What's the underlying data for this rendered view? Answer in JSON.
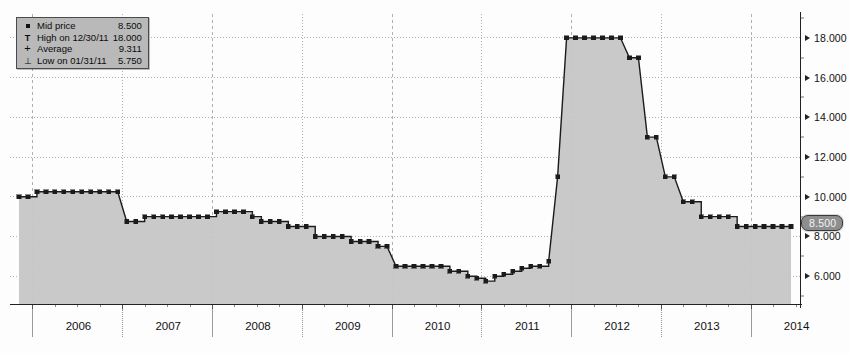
{
  "legend": {
    "rows": [
      {
        "glyph": "square-marker",
        "label": "Mid price",
        "value": "8.500"
      },
      {
        "glyph": "high-marker",
        "label": "High on 12/30/11",
        "value": "18.000"
      },
      {
        "glyph": "average-marker",
        "label": "Average",
        "value": "9.311"
      },
      {
        "glyph": "low-marker",
        "label": "Low on 01/31/11",
        "value": "5.750"
      }
    ]
  },
  "price_badge": {
    "value": "8.500"
  },
  "colors": {
    "line": "#1b1b1b",
    "fill": "#c6c6c6",
    "grid": "#b0b0b0",
    "axis": "#222222",
    "badge_bg": "#8e8e8e",
    "legend_bg": "#b9b9b9"
  },
  "chart_data": {
    "type": "area",
    "title": "",
    "xlabel": "",
    "ylabel": "",
    "grid": true,
    "legend_position": "top-left",
    "xlim": [
      2005.75,
      2014.55
    ],
    "ylim": [
      4.6,
      19.2
    ],
    "yticks": [
      6.0,
      8.0,
      10.0,
      12.0,
      14.0,
      16.0,
      18.0
    ],
    "ytick_labels": [
      "6.000",
      "8.000",
      "10.000",
      "12.000",
      "14.000",
      "16.000",
      "18.000"
    ],
    "xticks": [
      2006,
      2007,
      2008,
      2009,
      2010,
      2011,
      2012,
      2013,
      2014
    ],
    "xtick_labels": [
      "2006",
      "2007",
      "2008",
      "2009",
      "2010",
      "2011",
      "2012",
      "2013",
      "2014"
    ],
    "annotations": {
      "high": {
        "label": "High on 12/30/11",
        "value": 18.0
      },
      "low": {
        "label": "Low on 01/31/11",
        "value": 5.75
      },
      "average": {
        "label": "Average",
        "value": 9.311
      },
      "last": {
        "label": "Mid price",
        "value": 8.5
      }
    },
    "series": [
      {
        "name": "Mid price",
        "marker": "square",
        "x": [
          2005.85,
          2005.95,
          2006.05,
          2006.15,
          2006.25,
          2006.35,
          2006.45,
          2006.55,
          2006.65,
          2006.75,
          2006.85,
          2006.95,
          2007.05,
          2007.15,
          2007.25,
          2007.35,
          2007.45,
          2007.55,
          2007.65,
          2007.75,
          2007.85,
          2007.95,
          2008.05,
          2008.15,
          2008.25,
          2008.35,
          2008.45,
          2008.55,
          2008.65,
          2008.75,
          2008.85,
          2008.95,
          2009.05,
          2009.15,
          2009.25,
          2009.35,
          2009.45,
          2009.55,
          2009.65,
          2009.75,
          2009.85,
          2009.95,
          2010.05,
          2010.15,
          2010.25,
          2010.35,
          2010.45,
          2010.55,
          2010.65,
          2010.75,
          2010.85,
          2010.95,
          2011.05,
          2011.15,
          2011.25,
          2011.35,
          2011.45,
          2011.55,
          2011.65,
          2011.75,
          2011.85,
          2011.95,
          2012.05,
          2012.15,
          2012.25,
          2012.35,
          2012.45,
          2012.55,
          2012.65,
          2012.75,
          2012.85,
          2012.95,
          2013.05,
          2013.15,
          2013.25,
          2013.35,
          2013.45,
          2013.55,
          2013.65,
          2013.75,
          2013.85,
          2013.95,
          2014.05,
          2014.15,
          2014.25,
          2014.35,
          2014.45
        ],
        "values": [
          10.0,
          10.0,
          10.25,
          10.25,
          10.25,
          10.25,
          10.25,
          10.25,
          10.25,
          10.25,
          10.25,
          10.25,
          8.75,
          8.75,
          9.0,
          9.0,
          9.0,
          9.0,
          9.0,
          9.0,
          9.0,
          9.0,
          9.25,
          9.25,
          9.25,
          9.25,
          9.0,
          8.75,
          8.75,
          8.75,
          8.5,
          8.5,
          8.5,
          8.0,
          8.0,
          8.0,
          8.0,
          7.75,
          7.75,
          7.75,
          7.5,
          7.5,
          6.5,
          6.5,
          6.5,
          6.5,
          6.5,
          6.5,
          6.25,
          6.25,
          6.0,
          5.9,
          5.75,
          6.0,
          6.1,
          6.25,
          6.4,
          6.5,
          6.5,
          6.75,
          11.0,
          18.0,
          18.0,
          18.0,
          18.0,
          18.0,
          18.0,
          18.0,
          17.0,
          17.0,
          13.0,
          13.0,
          11.0,
          11.0,
          9.75,
          9.75,
          9.0,
          9.0,
          9.0,
          9.0,
          8.5,
          8.5,
          8.5,
          8.5,
          8.5,
          8.5,
          8.5
        ]
      }
    ]
  }
}
